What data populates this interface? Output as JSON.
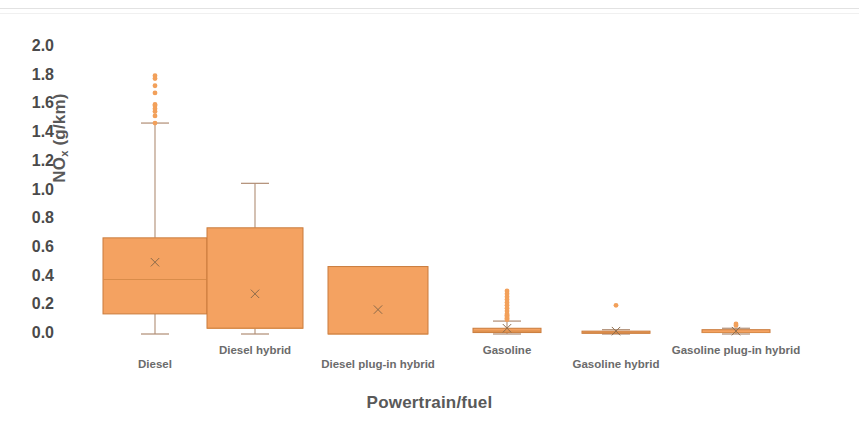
{
  "chart_data": {
    "type": "box",
    "title": "",
    "xlabel": "Powertrain/fuel",
    "ylabel": "NOx (g/km)",
    "ylabel_base": "NO",
    "ylabel_sub": "x",
    "ylabel_unit": " (g/km)",
    "ylim": [
      0.0,
      2.0
    ],
    "ytick_labels": [
      "2.0",
      "1.8",
      "1.6",
      "1.4",
      "1.2",
      "1.0",
      "0.8",
      "0.6",
      "0.4",
      "0.2",
      "0.0"
    ],
    "ytick_values": [
      2.0,
      1.8,
      1.6,
      1.4,
      1.2,
      1.0,
      0.8,
      0.6,
      0.4,
      0.2,
      0.0
    ],
    "grid": false,
    "legend": "none",
    "box_fill_color": "#F4A261",
    "box_line_color": "#C97B3C",
    "whisker_color": "#B08D74",
    "outlier_color": "#F2A05A",
    "mean_marker": "x",
    "categories": [
      "Diesel",
      "Diesel hybrid",
      "Diesel plug-in hybrid",
      "Gasoline",
      "Gasoline hybrid",
      "Gasoline plug-in hybrid"
    ],
    "boxes": [
      {
        "category": "Diesel",
        "whisker_low": 0.0,
        "q1": 0.14,
        "median": 0.38,
        "mean": 0.5,
        "q3": 0.67,
        "whisker_high": 1.47,
        "outliers": [
          1.8,
          1.78,
          1.73,
          1.68,
          1.6,
          1.59,
          1.57,
          1.55,
          1.52,
          1.47
        ]
      },
      {
        "category": "Diesel hybrid",
        "whisker_low": 0.0,
        "q1": 0.04,
        "median": 0.04,
        "mean": 0.28,
        "q3": 0.74,
        "whisker_high": 1.05,
        "outliers": []
      },
      {
        "category": "Diesel plug-in hybrid",
        "whisker_low": 0.0,
        "q1": 0.0,
        "median": 0.0,
        "mean": 0.17,
        "q3": 0.47,
        "whisker_high": 0.47,
        "outliers": []
      },
      {
        "category": "Gasoline",
        "whisker_low": 0.0,
        "q1": 0.01,
        "median": 0.02,
        "mean": 0.04,
        "q3": 0.04,
        "whisker_high": 0.09,
        "outliers": [
          0.3,
          0.28,
          0.26,
          0.24,
          0.22,
          0.2,
          0.18,
          0.16,
          0.14,
          0.13,
          0.12,
          0.11,
          0.1
        ]
      },
      {
        "category": "Gasoline hybrid",
        "whisker_low": 0.0,
        "q1": 0.01,
        "median": 0.01,
        "mean": 0.02,
        "q3": 0.02,
        "whisker_high": 0.03,
        "outliers": [
          0.2
        ]
      },
      {
        "category": "Gasoline plug-in hybrid",
        "whisker_low": 0.0,
        "q1": 0.01,
        "median": 0.01,
        "mean": 0.02,
        "q3": 0.03,
        "whisker_high": 0.04,
        "outliers": [
          0.07,
          0.06
        ]
      }
    ]
  },
  "axis": {
    "y_title_base": "NO",
    "y_title_sub": "x",
    "y_title_unit": " (g/km)",
    "x_title": "Powertrain/fuel"
  },
  "xtick_labels": [
    "Diesel",
    "Diesel hybrid",
    "Diesel plug-in hybrid",
    "Gasoline",
    "Gasoline hybrid",
    "Gasoline plug-in hybrid"
  ]
}
